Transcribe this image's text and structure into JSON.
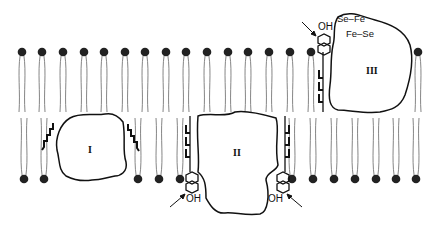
{
  "diagram": {
    "type": "membrane-protein-schematic",
    "colors": {
      "ink": "#1a1a1a",
      "lipid_head": "#222222",
      "tail": "#555555",
      "background": "#ffffff"
    },
    "bilayer": {
      "top_heads_x": [
        22,
        42,
        63,
        84,
        104,
        125,
        145,
        166,
        186,
        207,
        228,
        248,
        269,
        290,
        311,
        418
      ],
      "top_heads_y": 52,
      "bottom_heads_x": [
        24,
        44,
        138,
        159,
        180,
        292,
        313,
        334,
        355,
        376,
        396,
        416
      ],
      "bottom_heads_y": 179
    },
    "proteins": [
      {
        "id": "protein-I",
        "label": "I"
      },
      {
        "id": "protein-II",
        "label": "II"
      },
      {
        "id": "protein-III",
        "label": "III"
      }
    ],
    "annotations": {
      "oh_top": "OH",
      "oh_bottom_left": "OH",
      "oh_bottom_right": "OH",
      "se_fe_line1": "Se–Fe",
      "se_fe_line2": "Fe–Se"
    }
  }
}
